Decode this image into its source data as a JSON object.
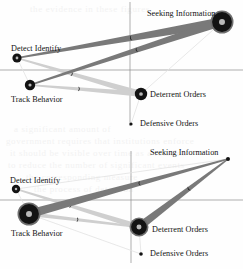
{
  "figure": {
    "name": "two-panel influence diagram",
    "width": 243,
    "height": 269,
    "background": "#fefefe"
  },
  "palette": {
    "node_fill": "#131313",
    "node_ring": "#6f6f6f",
    "node_core": "#b9b9b9",
    "ribbon_dark": "#797979",
    "ribbon_mid": "#a9a9a9",
    "ribbon_light": "#cfcfcf",
    "ribbon_faint": "#e2e2e2",
    "axis": "#8d8d8d",
    "text": "#111111",
    "ghost_text": "#f2f2f2"
  },
  "ghost_text": [
    {
      "text": "the evidence in these figures",
      "x": 30,
      "y": 4
    },
    {
      "text": "a  significant  amount  of",
      "x": 14,
      "y": 124
    },
    {
      "text": "government  requires  that  institutions  enforce",
      "x": 6,
      "y": 136
    },
    {
      "text": "it  should  be  visible  over  time  as  a  relation",
      "x": 10,
      "y": 148
    },
    {
      "text": "to  reduce  the  number  of  significant  events",
      "x": 8,
      "y": 160
    },
    {
      "text": "the  corresponding  measure",
      "x": 26,
      "y": 172
    },
    {
      "text": "the  process  of  detection",
      "x": 34,
      "y": 184
    }
  ],
  "panels": [
    {
      "id": "panel-top",
      "name": "upper-influence-diagram",
      "axes": {
        "vertical_x": 130,
        "horizontal_y": 70,
        "x_min": 0,
        "x_max": 243,
        "y_min": 2,
        "y_max": 126
      },
      "nodes": [
        {
          "id": "seeking-information",
          "label": "Seeking Information",
          "cx": 222,
          "cy": 22,
          "r": 11.5,
          "label_x": 147,
          "label_y": 9,
          "size": "large"
        },
        {
          "id": "detect-identify",
          "label": "Detect Identify",
          "cx": 17,
          "cy": 58,
          "r": 4.6,
          "label_x": 11,
          "label_y": 44,
          "size": "small"
        },
        {
          "id": "track-behavior",
          "label": "Track Behavior",
          "cx": 30,
          "cy": 85,
          "r": 5.2,
          "label_x": 11,
          "label_y": 95,
          "size": "small"
        },
        {
          "id": "deterrent-orders",
          "label": "Deterrent Orders",
          "cx": 141,
          "cy": 94,
          "r": 6.2,
          "label_x": 150,
          "label_y": 90,
          "size": "medium"
        },
        {
          "id": "defensive-orders",
          "label": "Defensive Orders",
          "cx": 131,
          "cy": 124,
          "r": 1.6,
          "label_x": 140,
          "label_y": 119,
          "size": "tiny"
        }
      ],
      "edges": [
        {
          "from": "seeking-information",
          "to": "detect-identify",
          "tone": "dark",
          "w_start": 9.5,
          "w_end": 1.5,
          "marker": true
        },
        {
          "from": "seeking-information",
          "to": "track-behavior",
          "tone": "dark",
          "w_start": 8.0,
          "w_end": 1.5,
          "marker": true
        },
        {
          "from": "detect-identify",
          "to": "deterrent-orders",
          "tone": "light",
          "w_start": 1.5,
          "w_end": 6.0,
          "marker": true
        },
        {
          "from": "track-behavior",
          "to": "deterrent-orders",
          "tone": "light",
          "w_start": 1.5,
          "w_end": 5.5,
          "marker": true
        },
        {
          "from": "detect-identify",
          "to": "seeking-information",
          "tone": "faint",
          "w_start": 1.0,
          "w_end": 1.0,
          "marker": false
        },
        {
          "from": "track-behavior",
          "to": "seeking-information",
          "tone": "faint",
          "w_start": 1.0,
          "w_end": 1.0,
          "marker": false
        },
        {
          "from": "deterrent-orders",
          "to": "seeking-information",
          "tone": "faint",
          "w_start": 1.0,
          "w_end": 1.0,
          "marker": false
        },
        {
          "from": "detect-identify",
          "to": "track-behavior",
          "tone": "faint",
          "w_start": 1.0,
          "w_end": 1.0,
          "marker": false
        },
        {
          "from": "deterrent-orders",
          "to": "defensive-orders",
          "tone": "faint",
          "w_start": 1.0,
          "w_end": 1.0,
          "marker": false
        }
      ]
    },
    {
      "id": "panel-bot",
      "name": "lower-influence-diagram",
      "axes": {
        "vertical_x": 131,
        "horizontal_y": 67,
        "x_min": 0,
        "x_max": 243,
        "y_min": 18,
        "y_max": 130
      },
      "nodes": [
        {
          "id": "seeking-information",
          "label": "Seeking Information",
          "cx": 228,
          "cy": 26,
          "r": 2.0,
          "label_x": 150,
          "label_y": 15,
          "size": "tiny"
        },
        {
          "id": "detect-identify",
          "label": "Detect Identify",
          "cx": 16,
          "cy": 56,
          "r": 4.2,
          "label_x": 10,
          "label_y": 43,
          "size": "small"
        },
        {
          "id": "track-behavior",
          "label": "Track Behavior",
          "cx": 29,
          "cy": 81,
          "r": 11.5,
          "label_x": 11,
          "label_y": 96,
          "size": "large"
        },
        {
          "id": "deterrent-orders",
          "label": "Deterrent Orders",
          "cx": 139,
          "cy": 94,
          "r": 9.5,
          "label_x": 152,
          "label_y": 92,
          "size": "large"
        },
        {
          "id": "defensive-orders",
          "label": "Defensive Orders",
          "cx": 141,
          "cy": 121,
          "r": 1.8,
          "label_x": 150,
          "label_y": 116,
          "size": "tiny"
        }
      ],
      "edges": [
        {
          "from": "seeking-information",
          "to": "track-behavior",
          "tone": "dark",
          "w_start": 1.5,
          "w_end": 9.0,
          "marker": true
        },
        {
          "from": "seeking-information",
          "to": "deterrent-orders",
          "tone": "dark",
          "w_start": 1.5,
          "w_end": 8.0,
          "marker": true
        },
        {
          "from": "detect-identify",
          "to": "deterrent-orders",
          "tone": "light",
          "w_start": 1.5,
          "w_end": 6.0,
          "marker": true
        },
        {
          "from": "track-behavior",
          "to": "deterrent-orders",
          "tone": "light",
          "w_start": 4.0,
          "w_end": 2.0,
          "marker": true
        },
        {
          "from": "detect-identify",
          "to": "seeking-information",
          "tone": "faint",
          "w_start": 1.0,
          "w_end": 1.0,
          "marker": false
        },
        {
          "from": "track-behavior",
          "to": "seeking-information",
          "tone": "faint",
          "w_start": 1.0,
          "w_end": 1.0,
          "marker": false
        },
        {
          "from": "detect-identify",
          "to": "track-behavior",
          "tone": "faint",
          "w_start": 1.0,
          "w_end": 1.0,
          "marker": false
        },
        {
          "from": "track-behavior",
          "to": "defensive-orders",
          "tone": "faint",
          "w_start": 1.0,
          "w_end": 1.0,
          "marker": false
        },
        {
          "from": "deterrent-orders",
          "to": "defensive-orders",
          "tone": "faint",
          "w_start": 1.0,
          "w_end": 1.0,
          "marker": false
        }
      ]
    }
  ]
}
